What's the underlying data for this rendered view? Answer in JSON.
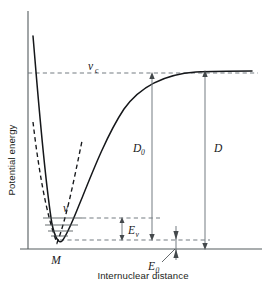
{
  "figure": {
    "type": "potential-energy-curve",
    "axes": {
      "ylabel": "Potential energy",
      "xlabel": "Internuclear distance",
      "x_origin_px": 28,
      "x_end_px": 262,
      "y_top_px": 11,
      "y_baseline_px": 249
    },
    "labels": {
      "convergence_limit": {
        "main": "v",
        "sub": "c"
      },
      "dissociation_from_zero_point": {
        "main": "D",
        "sub": "0"
      },
      "dissociation_from_minimum": {
        "main": "D",
        "sub": ""
      },
      "vibrational_quantum_number": {
        "main": "v",
        "sub": ""
      },
      "vibrational_energy": {
        "main": "E",
        "sub": "v"
      },
      "zero_point_energy": {
        "main": "E",
        "sub": "0"
      },
      "minimum_marker": {
        "main": "M",
        "sub": ""
      }
    },
    "colors": {
      "curve": "#15171a",
      "parabola": "#15171a",
      "guide_dashed": "#6d757a",
      "axis": "#555c5f",
      "vibrational_level": "#4c5355",
      "text": "#17191c",
      "background": "#ffffff"
    },
    "geometry": {
      "well_minimum_x_px": 57,
      "well_minimum_y_px": 243,
      "asymptote_y_px": 73,
      "vc_dash_y_px": 73,
      "upper_vib_dash_y_px": 218,
      "lower_vib_dash_y_px": 240,
      "D0_arrow_x_px": 152,
      "D_arrow_x_px": 205,
      "Ev_arrow_x_px": 122,
      "E0_arrow_x_px": 176
    },
    "vibrational_levels_y_px": [
      218,
      225,
      231,
      236
    ],
    "morse": {
      "description": "Morse-type potential: steep repulsive wall at small r, minimum M, asymptotic approach to convergence limit v_c at large r",
      "dashed_parabola_note": "harmonic-oscillator parabola tangent at the minimum, diverging above the well"
    }
  }
}
